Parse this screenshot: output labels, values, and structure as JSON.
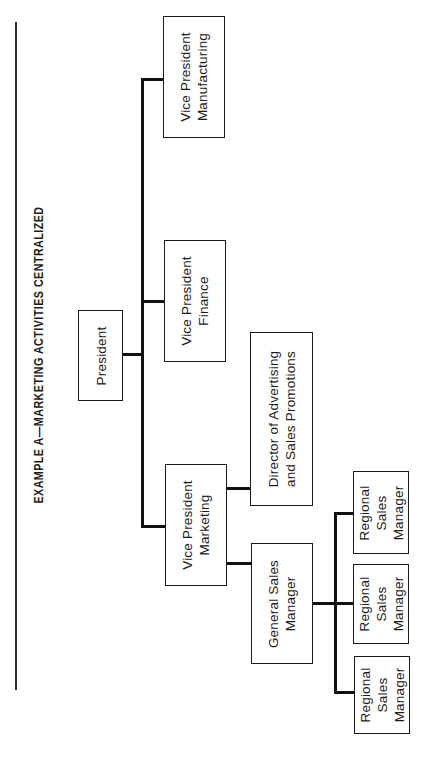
{
  "title": "EXAMPLE A—MARKETING ACTIVITIES CENTRALIZED",
  "nodes": {
    "president": {
      "lines": [
        "President"
      ]
    },
    "vp_manufacturing": {
      "lines": [
        "Vice President",
        "Manufacturing"
      ]
    },
    "vp_finance": {
      "lines": [
        "Vice President",
        "Finance"
      ]
    },
    "vp_marketing": {
      "lines": [
        "Vice President",
        "Marketing"
      ]
    },
    "director_advertising": {
      "lines": [
        "Director of Advertising",
        "and Sales Promotions"
      ]
    },
    "general_sales_manager": {
      "lines": [
        "General Sales",
        "Manager"
      ]
    },
    "regional_1": {
      "lines": [
        "Regional",
        "Sales",
        "Manager"
      ]
    },
    "regional_2": {
      "lines": [
        "Regional",
        "Sales",
        "Manager"
      ]
    },
    "regional_3": {
      "lines": [
        "Regional",
        "Sales",
        "Manager"
      ]
    }
  },
  "hierarchy": {
    "President": [
      "Vice President Manufacturing",
      "Vice President Finance",
      "Vice President Marketing"
    ],
    "Vice President Marketing": [
      "Director of Advertising and Sales Promotions",
      "General Sales Manager"
    ],
    "General Sales Manager": [
      "Regional Sales Manager",
      "Regional Sales Manager",
      "Regional Sales Manager"
    ]
  }
}
